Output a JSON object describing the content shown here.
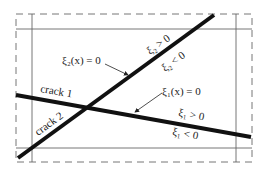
{
  "diagram": {
    "title": "",
    "domain": {
      "outer_boundary": "dashed",
      "inner_boundary": "solid"
    },
    "cracks": [
      {
        "id": "crack1",
        "label": "crack 1"
      },
      {
        "id": "crack2",
        "label": "crack 2"
      }
    ],
    "labels": {
      "xi2_zero": "ξ₂(x) = 0",
      "xi2_pos": "ξ₂ > 0",
      "xi2_neg": "ξ₂ < 0",
      "xi1_zero": "ξ₁(x) = 0",
      "xi1_pos": "ξ₁ > 0",
      "xi1_neg": "ξ₁ < 0",
      "crack1": "crack 1",
      "crack2": "crack 2"
    },
    "colors": {
      "line": "#111111",
      "frame": "#666666",
      "text": "#222222"
    }
  }
}
